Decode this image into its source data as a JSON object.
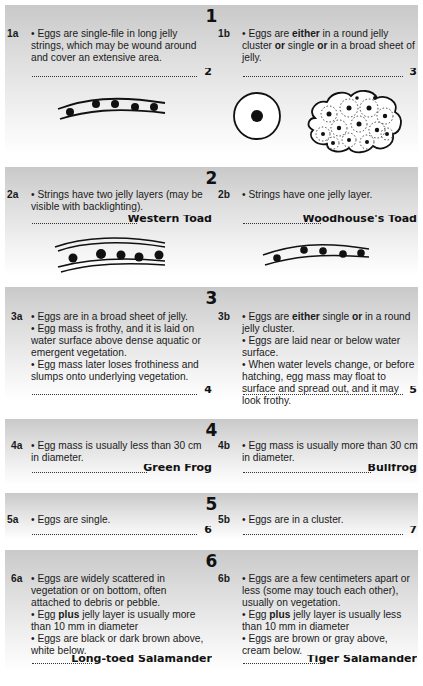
{
  "key": [
    {
      "number": "1",
      "a": {
        "label": "1a",
        "lines": [
          "• Eggs are single-file in long jelly strings, which may be wound around and cover an extensive area."
        ],
        "goto": "2",
        "illustration": "single-jelly-string-icon"
      },
      "b": {
        "label": "1b",
        "lines_rich": [
          {
            "t": "• Eggs are "
          },
          {
            "b": "either"
          },
          {
            "t": " in a round jelly cluster "
          },
          {
            "b": "or"
          },
          {
            "t": " single "
          },
          {
            "b": "or"
          },
          {
            "t": " in a broad sheet of jelly."
          }
        ],
        "goto": "3",
        "illustrations": [
          "single-egg-icon",
          "egg-cluster-icon"
        ]
      }
    },
    {
      "number": "2",
      "a": {
        "label": "2a",
        "lines": [
          "• Strings have two jelly layers (may be visible with backlighting)."
        ],
        "species": "Western Toad",
        "illustration": "double-jelly-string-icon"
      },
      "b": {
        "label": "2b",
        "lines": [
          "• Strings have one jelly layer."
        ],
        "species": "Woodhouse's Toad",
        "illustration": "single-jelly-string-icon"
      }
    },
    {
      "number": "3",
      "a": {
        "label": "3a",
        "lines": [
          "• Eggs are in a broad sheet of jelly.",
          "• Egg mass is frothy, and it is laid on water surface above dense aquatic or emergent vegetation.",
          "• Egg mass later loses frothiness and slumps onto underlying vegetation."
        ],
        "goto": "4"
      },
      "b": {
        "label": "3b",
        "lines_rich": [
          {
            "t": "• Eggs are "
          },
          {
            "b": "either"
          },
          {
            "t": " single "
          },
          {
            "b": "or"
          },
          {
            "t": " in a round jelly cluster."
          }
        ],
        "lines": [
          "• Eggs are laid near or below water surface.",
          "• When water levels change, or before hatching, egg mass may float to surface and spread out, and it may look frothy."
        ],
        "goto": "5"
      }
    },
    {
      "number": "4",
      "a": {
        "label": "4a",
        "lines": [
          "• Egg mass is usually less than 30 cm in diameter."
        ],
        "species": "Green Frog"
      },
      "b": {
        "label": "4b",
        "lines": [
          "• Egg mass is usually more than 30 cm in diameter."
        ],
        "species": "Bullfrog"
      }
    },
    {
      "number": "5",
      "a": {
        "label": "5a",
        "lines": [
          "• Eggs are single."
        ],
        "goto": "6"
      },
      "b": {
        "label": "5b",
        "lines": [
          "• Eggs are in a cluster."
        ],
        "goto": "7"
      }
    },
    {
      "number": "6",
      "a": {
        "label": "6a",
        "lines": [
          "• Eggs are widely scattered in vegetation or on bottom, often attached to debris or pebble."
        ],
        "plus_line": {
          "pre": "• Egg ",
          "bold": "plus",
          "post": " jelly layer is usually more than 10 mm in diameter"
        },
        "lines2": [
          "• Eggs are black or dark brown above, white below."
        ],
        "species": "Long-toed Salamander"
      },
      "b": {
        "label": "6b",
        "lines": [
          "• Eggs are a few centimeters apart or less (some may touch each other), usually on vegetation."
        ],
        "plus_line": {
          "pre": "• Egg ",
          "bold": "plus",
          "post": " jelly layer is usually less than 10 mm in diameter"
        },
        "lines2": [
          "• Eggs are brown or gray above, cream below."
        ],
        "species": "Tiger Salamander"
      }
    }
  ]
}
